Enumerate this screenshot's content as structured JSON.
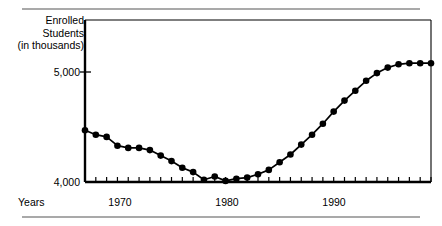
{
  "chart_data": {
    "type": "line",
    "title": "",
    "xlabel": "Years",
    "ylabel": "Enrolled Students (in thousands)",
    "ylabel_lines": [
      "Enrolled",
      "Students",
      "(in thousands)"
    ],
    "xlim": [
      1966,
      1998
    ],
    "ylim": [
      4000,
      5100
    ],
    "yticks": [
      4000,
      5000
    ],
    "ytick_labels": [
      "4,000",
      "5,000"
    ],
    "xticks": [
      1966,
      1967,
      1968,
      1969,
      1970,
      1971,
      1972,
      1973,
      1974,
      1975,
      1976,
      1977,
      1978,
      1979,
      1980,
      1981,
      1982,
      1983,
      1984,
      1985,
      1986,
      1987,
      1988,
      1989,
      1990,
      1991,
      1992,
      1993,
      1994,
      1995,
      1996,
      1997,
      1998
    ],
    "xtick_labels": [
      "1970",
      "1980",
      "1990"
    ],
    "xtick_label_values": [
      1970,
      1980,
      1990
    ],
    "grid": false,
    "legend": false,
    "marker": "filled-circle",
    "line_color": "#000000",
    "marker_color": "#000000",
    "x": [
      1966,
      1967,
      1968,
      1969,
      1970,
      1971,
      1972,
      1973,
      1974,
      1975,
      1976,
      1977,
      1978,
      1979,
      1980,
      1981,
      1982,
      1983,
      1984,
      1985,
      1986,
      1987,
      1988,
      1989,
      1990,
      1991,
      1992,
      1993,
      1994,
      1995,
      1996,
      1997,
      1998
    ],
    "values": [
      4470,
      4430,
      4410,
      4330,
      4310,
      4310,
      4290,
      4240,
      4190,
      4130,
      4090,
      4020,
      4050,
      4010,
      4030,
      4040,
      4070,
      4110,
      4180,
      4250,
      4340,
      4430,
      4530,
      4640,
      4740,
      4830,
      4920,
      4990,
      5040,
      5070,
      5080,
      5080,
      5080
    ],
    "series_name": "Enrolled Students"
  },
  "axis": {
    "y_label_lines": [
      "Enrolled",
      "Students",
      "(in thousands)"
    ],
    "y_tick_5000": "5,000",
    "y_tick_4000": "4,000",
    "x_title": "Years",
    "x_label_1970": "1970",
    "x_label_1980": "1980",
    "x_label_1990": "1990"
  }
}
